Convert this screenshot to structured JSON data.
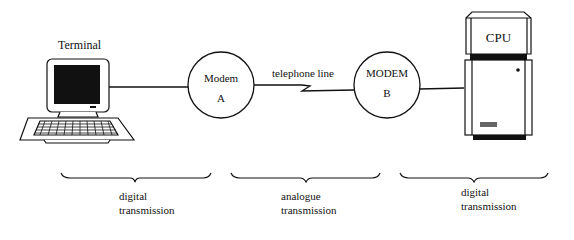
{
  "diagram": {
    "nodes": {
      "terminal": {
        "label": "Terminal",
        "icon": "terminal-icon"
      },
      "modem_a": {
        "line1": "Modem",
        "line2": "A"
      },
      "modem_b": {
        "line1": "MODEM",
        "line2": "B"
      },
      "cpu": {
        "label": "CPU",
        "icon": "computer-tower-icon"
      }
    },
    "link": {
      "label": "telephone line"
    },
    "segments": [
      {
        "line1": "digital",
        "line2": "transmission"
      },
      {
        "line1": "analogue",
        "line2": "transmission"
      },
      {
        "line1": "digital",
        "line2": "transmission"
      }
    ],
    "colors": {
      "ink": "#111111",
      "background": "#ffffff"
    }
  }
}
